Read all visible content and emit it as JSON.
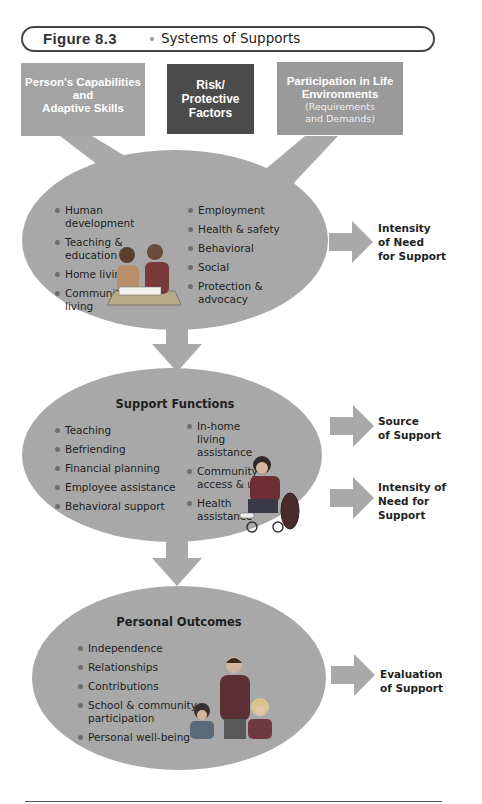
{
  "figure": {
    "number": "Figure 8.3",
    "title": "Systems of Supports"
  },
  "colors": {
    "ellipse_fill": "#a8a8a8",
    "box_capabilities": "#a3a3a3",
    "box_risk": "#4b4b4b",
    "box_participation": "#9a9a9a",
    "arrow_fill": "#a9a9a9",
    "text_dark": "#1f1f1f"
  },
  "input_boxes": [
    {
      "line1": "Person's Capabilities",
      "line2": "and",
      "line3": "Adaptive Skills"
    },
    {
      "line1": "Risk/",
      "line2": "Protective",
      "line3": "Factors"
    },
    {
      "line1": "Participation in Life",
      "line2": "Environments",
      "sub1": "(Requirements",
      "sub2": "and Demands)"
    }
  ],
  "areas_ellipse": {
    "left_items": [
      "Human development",
      "Teaching & education",
      "Home living",
      "Community living"
    ],
    "right_items": [
      "Employment",
      "Health & safety",
      "Behavioral",
      "Social",
      "Protection & advocacy"
    ],
    "illustration": "teacher-and-child-reading-illustration",
    "side_output": {
      "line1": "Intensity",
      "line2": "of Need",
      "line3": "for Support"
    }
  },
  "support_functions_ellipse": {
    "heading": "Support Functions",
    "left_items": [
      "Teaching",
      "Befriending",
      "Financial planning",
      "Employee assistance",
      "Behavioral support"
    ],
    "right_items": [
      "In-home living assistance",
      "Community access & use",
      "Health assistance"
    ],
    "illustration": "child-in-wheelchair-illustration",
    "side_outputs": [
      {
        "line1": "Source",
        "line2": "of Support"
      },
      {
        "line1": "Intensity of",
        "line2": "Need for",
        "line3": "Support"
      }
    ]
  },
  "personal_outcomes_ellipse": {
    "heading": "Personal Outcomes",
    "items": [
      "Independence",
      "Relationships",
      "Contributions",
      "School & community participation",
      "Personal well-being"
    ],
    "illustration": "adult-with-two-children-illustration",
    "side_output": {
      "line1": "Evaluation",
      "line2": "of Support"
    }
  }
}
